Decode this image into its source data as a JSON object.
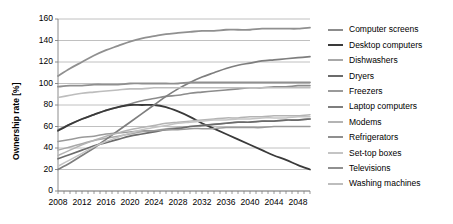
{
  "chart_data": {
    "type": "line",
    "title": "",
    "xlabel": "",
    "ylabel": "Ownership rate [%]",
    "xlim": [
      2008,
      2050
    ],
    "ylim": [
      0,
      160
    ],
    "ytick_step": 20,
    "xtick_step": 4,
    "grid": "horizontal",
    "legend_position": "right",
    "x_ticks": [
      "2008",
      "2012",
      "2016",
      "2020",
      "2024",
      "2028",
      "2032",
      "2036",
      "2040",
      "2044",
      "2048"
    ],
    "y_ticks": [
      "0",
      "20",
      "40",
      "60",
      "80",
      "100",
      "120",
      "140",
      "160"
    ],
    "x": [
      2008,
      2010,
      2012,
      2014,
      2016,
      2018,
      2020,
      2022,
      2024,
      2026,
      2028,
      2030,
      2032,
      2034,
      2036,
      2038,
      2040,
      2042,
      2044,
      2046,
      2048,
      2050
    ],
    "series": [
      {
        "name": "Computer screens",
        "color": "#8c8c8c",
        "width": 1.6,
        "values": [
          57,
          62,
          67,
          71,
          75,
          78,
          81,
          84,
          86,
          88,
          89,
          91,
          92,
          93,
          94,
          95,
          96,
          96,
          97,
          97,
          98,
          98
        ]
      },
      {
        "name": "Desktop computers",
        "color": "#3a3a3a",
        "width": 1.8,
        "values": [
          56,
          62,
          67,
          71,
          75,
          78,
          80,
          80,
          80,
          78,
          74,
          69,
          63,
          58,
          53,
          48,
          43,
          38,
          33,
          29,
          24,
          20
        ]
      },
      {
        "name": "Dishwashers",
        "color": "#a8a8a8",
        "width": 1.5,
        "values": [
          38,
          41,
          44,
          47,
          49,
          51,
          53,
          55,
          56,
          58,
          59,
          60,
          61,
          62,
          63,
          64,
          64,
          65,
          65,
          66,
          66,
          67
        ]
      },
      {
        "name": "Dryers",
        "color": "#6b6b6b",
        "width": 1.7,
        "values": [
          30,
          34,
          38,
          42,
          45,
          48,
          51,
          53,
          55,
          57,
          58,
          60,
          61,
          62,
          63,
          64,
          64,
          65,
          65,
          66,
          66,
          67
        ]
      },
      {
        "name": "Freezers",
        "color": "#9a9a9a",
        "width": 1.5,
        "values": [
          46,
          48,
          50,
          51,
          53,
          54,
          55,
          56,
          56,
          57,
          57,
          58,
          58,
          58,
          59,
          59,
          59,
          59,
          60,
          60,
          60,
          60
        ]
      },
      {
        "name": "Laptop computers",
        "color": "#7e7e7e",
        "width": 1.7,
        "values": [
          20,
          26,
          33,
          40,
          48,
          56,
          64,
          72,
          80,
          88,
          95,
          101,
          106,
          110,
          114,
          117,
          119,
          121,
          122,
          123,
          124,
          125
        ]
      },
      {
        "name": "Modems",
        "color": "#b4b4b4",
        "width": 1.5,
        "values": [
          33,
          38,
          43,
          47,
          51,
          54,
          57,
          59,
          61,
          63,
          64,
          65,
          66,
          67,
          68,
          68,
          69,
          69,
          70,
          70,
          70,
          71
        ]
      },
      {
        "name": "Refrigerators",
        "color": "#8f8f8f",
        "width": 1.8,
        "values": [
          97,
          98,
          98,
          99,
          99,
          99,
          100,
          100,
          100,
          100,
          100,
          101,
          101,
          101,
          101,
          101,
          101,
          101,
          101,
          101,
          101,
          101
        ]
      },
      {
        "name": "Set-top boxes",
        "color": "#c4c4c4",
        "width": 1.5,
        "values": [
          23,
          29,
          35,
          41,
          46,
          50,
          54,
          57,
          59,
          61,
          63,
          64,
          65,
          66,
          66,
          67,
          67,
          68,
          68,
          68,
          69,
          69
        ]
      },
      {
        "name": "Televisions",
        "color": "#909090",
        "width": 1.8,
        "values": [
          107,
          114,
          120,
          126,
          131,
          135,
          139,
          142,
          144,
          146,
          147,
          148,
          149,
          149,
          150,
          150,
          150,
          151,
          151,
          151,
          151,
          152
        ]
      },
      {
        "name": "Washing machines",
        "color": "#bdbdbd",
        "width": 1.6,
        "values": [
          87,
          89,
          91,
          92,
          93,
          94,
          95,
          95,
          96,
          96,
          96,
          96,
          96,
          96,
          96,
          96,
          96,
          96,
          96,
          96,
          96,
          96
        ]
      }
    ]
  }
}
